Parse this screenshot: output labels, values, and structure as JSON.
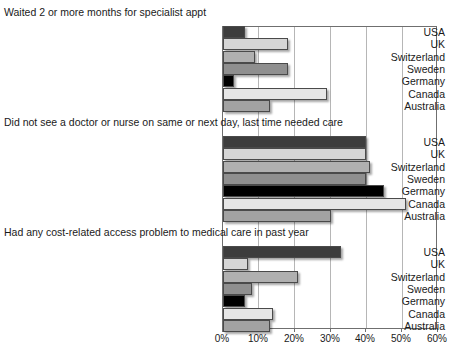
{
  "chart_data": {
    "type": "bar",
    "title": "",
    "orientation": "horizontal",
    "xlabel": "",
    "ylabel": "",
    "xlim": [
      0,
      60
    ],
    "xunit": "%",
    "grid": true,
    "legend": "none",
    "xticks": [
      "0%",
      "10%",
      "20%",
      "30%",
      "40%",
      "50%",
      "60%"
    ],
    "xtick_values": [
      0,
      10,
      20,
      30,
      40,
      50,
      60
    ],
    "categories": [
      "USA",
      "UK",
      "Switzerland",
      "Sweden",
      "Germany",
      "Canada",
      "Australia"
    ],
    "panels": [
      {
        "title": "Waited 2 or more months for specialist appt",
        "values": [
          6,
          18,
          9,
          18,
          3,
          29,
          13
        ]
      },
      {
        "title": "Did not see a doctor or nurse on same or next day, last time needed care",
        "values": [
          40,
          40,
          41,
          40,
          45,
          51,
          30
        ]
      },
      {
        "title": "Had any cost-related access problem to medical care in past year",
        "values": [
          33,
          7,
          21,
          8,
          6,
          14,
          13
        ]
      }
    ],
    "series_colors": {
      "USA": "#3d3d3d",
      "UK": "#d6d6d6",
      "Switzerland": "#b0b0b0",
      "Sweden": "#8f8f8f",
      "Germany": "#000000",
      "Canada": "#e6e6e6",
      "Australia": "#a2a2a2"
    }
  }
}
